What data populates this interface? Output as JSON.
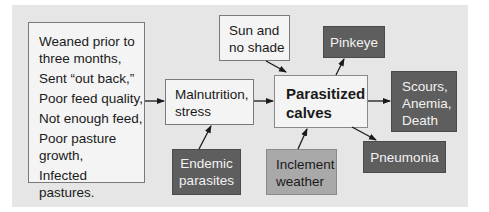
{
  "diagram": {
    "causes_box": {
      "lines": [
        "Weaned prior to",
        "three months,",
        "Sent “out back,”",
        "Poor feed quality,",
        "Not enough feed,",
        "Poor pasture",
        "growth,",
        "Infected pastures."
      ]
    },
    "malnutrition": {
      "lines": [
        "Malnutrition,",
        "stress"
      ]
    },
    "sun": {
      "lines": [
        "Sun and",
        "no shade"
      ]
    },
    "parasitized": {
      "lines": [
        "Parasitized",
        "calves"
      ]
    },
    "endemic": {
      "lines": [
        "Endemic",
        "parasites"
      ]
    },
    "inclement": {
      "lines": [
        "Inclement",
        "weather"
      ]
    },
    "pinkeye": {
      "lines": [
        "Pinkeye"
      ]
    },
    "scours": {
      "lines": [
        "Scours,",
        "Anemia,",
        "Death"
      ]
    },
    "pneumonia": {
      "lines": [
        "Pneumonia"
      ]
    }
  },
  "colors": {
    "background": "#e6e6e6",
    "light_box": "#f4f4f4",
    "dark_box": "#5e5e5e",
    "mid_box": "#a9a9a9",
    "arrow": "#1a1a1a"
  }
}
